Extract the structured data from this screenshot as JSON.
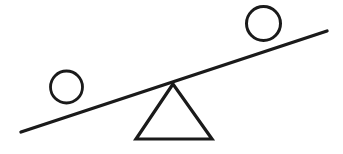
{
  "diagram": {
    "title": "Lever and fulcrum balance diagram",
    "background_color": "#ffffff",
    "stroke_color": "#1a1a1a",
    "canvas": {
      "width": 343,
      "height": 154
    },
    "elements": {
      "beam": {
        "label": "lever-beam",
        "x1": 21,
        "y1": 132,
        "x2": 327,
        "y2": 31,
        "stroke_width": 3.4
      },
      "fulcrum": {
        "label": "fulcrum-triangle",
        "apex_x": 173,
        "apex_y": 84,
        "base_left_x": 136,
        "base_right_x": 212,
        "base_y": 139,
        "stroke_width": 3.2
      },
      "left_ball": {
        "label": "left-circle",
        "cx": 66.5,
        "cy": 87,
        "r": 16,
        "stroke_width": 2.8
      },
      "right_ball": {
        "label": "right-circle",
        "cx": 263.5,
        "cy": 23.5,
        "r": 17,
        "stroke_width": 3
      }
    }
  }
}
